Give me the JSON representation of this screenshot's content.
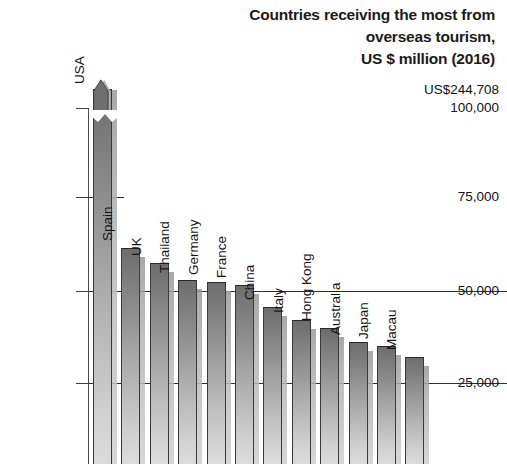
{
  "title": {
    "line1": "Countries receiving the most from",
    "line2": "overseas tourism,",
    "line3": "US $ million (2016)"
  },
  "axis": {
    "tick_labels": [
      "100,000",
      "75,000",
      "50,000",
      "25,000"
    ],
    "top_annotation": "US$244,708"
  },
  "chart_data": {
    "type": "bar",
    "title": "Countries receiving the most from overseas tourism, US $ million (2016)",
    "xlabel": "",
    "ylabel": "US $ million",
    "ylim": [
      0,
      100000
    ],
    "yticks": [
      25000,
      50000,
      75000,
      100000
    ],
    "ytick_labels": [
      "25,000",
      "50,000",
      "75,000",
      "100,000"
    ],
    "grid": "partial-horizontal",
    "legend": "none",
    "axis_break": true,
    "annotations": [
      {
        "text": "US$244,708",
        "target": "USA",
        "note": "true value of USA bar, axis broken above 100,000"
      }
    ],
    "categories": [
      "USA",
      "Spain",
      "UK",
      "Thailand",
      "Germany",
      "France",
      "China",
      "Italy",
      "Hong Kong",
      "Australia",
      "Japan",
      "Macau"
    ],
    "values": [
      244708,
      60000,
      56000,
      52000,
      51500,
      50800,
      45000,
      41500,
      39000,
      35000,
      34000,
      31000
    ]
  },
  "bars": [
    {
      "label": "USA",
      "value": 244708,
      "display_top_px": 108,
      "broken": true
    },
    {
      "label": "Spain",
      "value": 60000,
      "display_top_px": 248,
      "broken": false
    },
    {
      "label": "UK",
      "value": 56000,
      "display_top_px": 263,
      "broken": false
    },
    {
      "label": "Thailand",
      "value": 52000,
      "display_top_px": 280,
      "broken": false
    },
    {
      "label": "Germany",
      "value": 51500,
      "display_top_px": 282,
      "broken": false
    },
    {
      "label": "France",
      "value": 50800,
      "display_top_px": 285,
      "broken": false
    },
    {
      "label": "China",
      "value": 45000,
      "display_top_px": 307,
      "broken": false
    },
    {
      "label": "Italy",
      "value": 41500,
      "display_top_px": 320,
      "broken": false
    },
    {
      "label": "Hong Kong",
      "value": 39000,
      "display_top_px": 328,
      "broken": false
    },
    {
      "label": "Australia",
      "value": 35000,
      "display_top_px": 342,
      "broken": false
    },
    {
      "label": "Japan",
      "value": 34000,
      "display_top_px": 346,
      "broken": false
    },
    {
      "label": "Macau",
      "value": 31000,
      "display_top_px": 357,
      "broken": false
    }
  ],
  "colors": {
    "bar_top": "#6d6d6d",
    "bar_bottom": "#dcdcdc",
    "bar_outline": "#3a3a3a",
    "shadow": "#b5b5b5",
    "axis": "#3d3d3d",
    "text": "#111111",
    "background": "#ffffff"
  }
}
